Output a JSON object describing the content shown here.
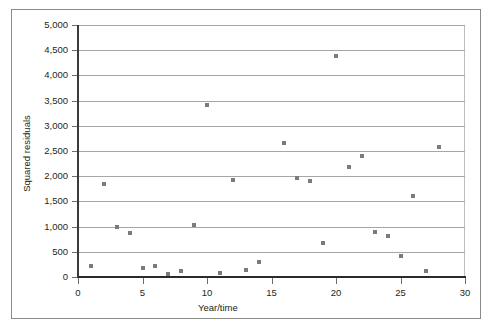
{
  "chart_data": {
    "type": "scatter",
    "title": "",
    "xlabel": "Year/time",
    "ylabel": "Squared residuals",
    "xlim": [
      0,
      30
    ],
    "ylim": [
      0,
      5000
    ],
    "xticks": [
      0,
      5,
      10,
      15,
      20,
      25,
      30
    ],
    "xtick_labels": [
      "0",
      "5",
      "10",
      "15",
      "20",
      "25",
      "30"
    ],
    "yticks": [
      0,
      500,
      1000,
      1500,
      2000,
      2500,
      3000,
      3500,
      4000,
      4500,
      5000
    ],
    "ytick_labels": [
      "0",
      "500",
      "1,000",
      "1,500",
      "2,000",
      "2,500",
      "3,000",
      "3,500",
      "4,000",
      "4,500",
      "5,000"
    ],
    "grid": "horizontal",
    "legend": "none",
    "marker": "square",
    "marker_color": "#7b7b7b",
    "series": [
      {
        "name": "Squared residuals",
        "points": [
          {
            "x": 1,
            "y": 220
          },
          {
            "x": 2,
            "y": 1850
          },
          {
            "x": 3,
            "y": 1000
          },
          {
            "x": 4,
            "y": 870
          },
          {
            "x": 5,
            "y": 170
          },
          {
            "x": 6,
            "y": 210
          },
          {
            "x": 7,
            "y": 60
          },
          {
            "x": 8,
            "y": 120
          },
          {
            "x": 9,
            "y": 1040
          },
          {
            "x": 10,
            "y": 3420
          },
          {
            "x": 11,
            "y": 70
          },
          {
            "x": 12,
            "y": 1930
          },
          {
            "x": 13,
            "y": 130
          },
          {
            "x": 14,
            "y": 300
          },
          {
            "x": 16,
            "y": 2650
          },
          {
            "x": 17,
            "y": 1960
          },
          {
            "x": 18,
            "y": 1910
          },
          {
            "x": 19,
            "y": 680
          },
          {
            "x": 20,
            "y": 4380
          },
          {
            "x": 21,
            "y": 2180
          },
          {
            "x": 22,
            "y": 2400
          },
          {
            "x": 23,
            "y": 900
          },
          {
            "x": 24,
            "y": 820
          },
          {
            "x": 25,
            "y": 420
          },
          {
            "x": 26,
            "y": 1600
          },
          {
            "x": 27,
            "y": 120
          },
          {
            "x": 28,
            "y": 2580
          }
        ]
      }
    ]
  }
}
